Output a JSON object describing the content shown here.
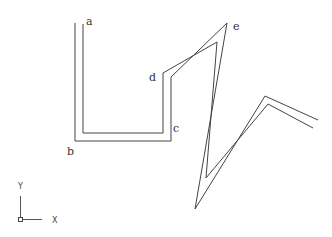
{
  "diagram": {
    "type": "double-line polyline (wall/offset path)",
    "vertex_labels": [
      {
        "id": "a",
        "text": "a",
        "x": 86,
        "y": 25
      },
      {
        "id": "b",
        "text": "b",
        "x": 67,
        "y": 155
      },
      {
        "id": "c",
        "text": "c",
        "x": 173,
        "y": 132
      },
      {
        "id": "d",
        "text": "d",
        "x": 149,
        "y": 81
      },
      {
        "id": "e",
        "text": "e",
        "x": 233,
        "y": 30
      }
    ],
    "outer_path": "M75,23 L75,141 L171,141 L171,77 L227,23 L195,209 L265,96 L318,120",
    "inner_path": "M83,24 L83,133 L163,133 L163,73 L217,42 L206,178 L268,104 L313,128",
    "stroke_color": "#444444",
    "background": "#ffffff"
  },
  "ucs_icon": {
    "x_label": "X",
    "y_label": "Y"
  }
}
